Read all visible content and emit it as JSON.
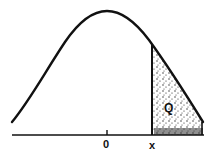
{
  "figure": {
    "curve": "bell-curve",
    "labels": {
      "mean": "0",
      "cutoff": "x",
      "area": "Q"
    },
    "colors": {
      "line": "#111111",
      "shade": "#222222",
      "background": "#ffffff"
    }
  }
}
